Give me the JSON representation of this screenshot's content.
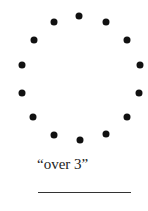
{
  "diagram": {
    "dot_count": 14,
    "dot_color": "#111111",
    "dots": [
      {
        "x": 79,
        "y": 16
      },
      {
        "x": 106,
        "y": 22
      },
      {
        "x": 127,
        "y": 40
      },
      {
        "x": 140,
        "y": 65
      },
      {
        "x": 139,
        "y": 93
      },
      {
        "x": 127,
        "y": 117
      },
      {
        "x": 106,
        "y": 134
      },
      {
        "x": 80,
        "y": 140
      },
      {
        "x": 54,
        "y": 135
      },
      {
        "x": 33,
        "y": 117
      },
      {
        "x": 22,
        "y": 93
      },
      {
        "x": 22,
        "y": 65
      },
      {
        "x": 34,
        "y": 40
      },
      {
        "x": 54,
        "y": 22
      }
    ],
    "caption": "“over 3”",
    "answer_line": ""
  }
}
